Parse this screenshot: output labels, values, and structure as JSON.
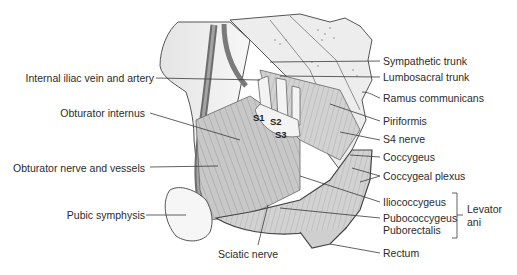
{
  "figure": {
    "left_labels": [
      {
        "id": "internal-iliac",
        "text": "Internal iliac vein and artery"
      },
      {
        "id": "obturator-internus",
        "text": "Obturator internus"
      },
      {
        "id": "obturator-nerve",
        "text": "Obturator nerve and vessels"
      },
      {
        "id": "pubic-symphysis",
        "text": "Pubic symphysis"
      }
    ],
    "bottom_labels": [
      {
        "id": "sciatic-nerve",
        "text": "Sciatic nerve"
      }
    ],
    "right_labels": [
      {
        "id": "sympathetic-trunk",
        "text": "Sympathetic trunk"
      },
      {
        "id": "lumbosacral-trunk",
        "text": "Lumbosacral trunk"
      },
      {
        "id": "ramus-communicans",
        "text": "Ramus communicans"
      },
      {
        "id": "piriformis",
        "text": "Piriformis"
      },
      {
        "id": "s4-nerve",
        "text": "S4 nerve"
      },
      {
        "id": "coccygeus",
        "text": "Coccygeus"
      },
      {
        "id": "coccygeal-plexus",
        "text": "Coccygeal plexus"
      },
      {
        "id": "iliococcygeus",
        "text": "Iliococcygeus"
      },
      {
        "id": "pubococcygeus",
        "text": "Pubococcygeus"
      },
      {
        "id": "puborectalis",
        "text": "Puborectalis"
      },
      {
        "id": "rectum",
        "text": "Rectum"
      }
    ],
    "group_label": {
      "line1": "Levator",
      "line2": "ani"
    },
    "sacral_segments": [
      "S1",
      "S2",
      "S3"
    ],
    "colors": {
      "line": "#3a3a3a",
      "bone": "#f2f2f2",
      "muscle": "#bdbdbd",
      "muscle_dark": "#8a8a8a",
      "vessel": "#6f6f6f"
    }
  }
}
